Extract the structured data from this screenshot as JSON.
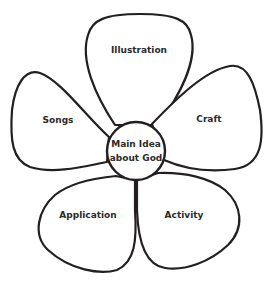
{
  "diagram": {
    "type": "flower-graphic-organizer",
    "center": {
      "line1": "Main Idea",
      "line2": "about God"
    },
    "petals": [
      {
        "id": "top",
        "label": "Illustration"
      },
      {
        "id": "left",
        "label": "Songs"
      },
      {
        "id": "right",
        "label": "Craft"
      },
      {
        "id": "bottom-left",
        "label": "Application"
      },
      {
        "id": "bottom-right",
        "label": "Activity"
      }
    ],
    "colors": {
      "stroke": "#231f20",
      "fill": "#ffffff",
      "text": "#2b2b2b"
    }
  }
}
